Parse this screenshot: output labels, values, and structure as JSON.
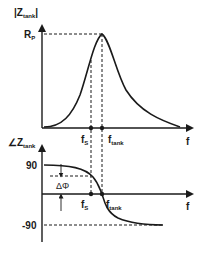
{
  "diagram": {
    "top_plot": {
      "y_label_main": "|Z",
      "y_label_sub": "tank",
      "y_label_close": "|",
      "peak_label_main": "R",
      "peak_label_sub": "P",
      "x_label": "f",
      "marker_1_main": "f",
      "marker_1_sub": "S",
      "marker_2_main": "f",
      "marker_2_sub": "tank"
    },
    "bottom_plot": {
      "y_label_main": "∠Z",
      "y_label_sub": "tank",
      "tick_top": "90",
      "tick_bottom": "-90",
      "delta_label": "ΔΦ",
      "x_label": "f",
      "marker_1_main": "f",
      "marker_1_sub": "S",
      "marker_2_main": "f",
      "marker_2_sub": "tank"
    },
    "colors": {
      "line": "#1a1a1a",
      "background": "#ffffff"
    }
  }
}
